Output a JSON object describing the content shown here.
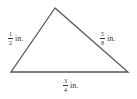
{
  "figure": {
    "type": "triangle",
    "vertices": {
      "apex": [
        55,
        8
      ],
      "left": [
        11,
        72
      ],
      "right": [
        128,
        72
      ]
    },
    "stroke_color": "#555555"
  },
  "labels": {
    "left_side": {
      "numerator": "1",
      "denominator": "2",
      "unit": "in."
    },
    "right_side": {
      "numerator": "5",
      "denominator": "8",
      "unit": "in."
    },
    "bottom_side": {
      "numerator": "3",
      "denominator": "4",
      "unit": "in."
    }
  }
}
